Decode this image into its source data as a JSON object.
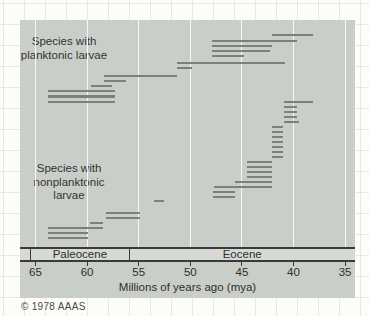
{
  "figure": {
    "copyright": "© 1978 AAAS"
  },
  "groups": {
    "planktonic": {
      "lines": [
        "Species with",
        "planktonic larvae"
      ]
    },
    "nonplanktonic": {
      "lines": [
        "Species with",
        "nonplanktonic",
        "larvae"
      ]
    }
  },
  "colors": {
    "panel_bg": "#cacec9",
    "bar": "#7d817c",
    "band_bg": "#d7dad4",
    "line_dark": "#3a3a3a",
    "text": "#333333",
    "gridline": "#ffffff"
  },
  "chart_data": {
    "type": "bar",
    "orientation": "horizontal-range",
    "xlabel": "Millions of years ago (mya)",
    "x_range": [
      65,
      35
    ],
    "x_axis_reversed": true,
    "x_ticks": [
      65,
      60,
      55,
      50,
      45,
      40,
      35
    ],
    "grid": "vertical-white-lines-at-ticks",
    "epochs": [
      {
        "name": "Paleocene",
        "from": 65.5,
        "to": 55.9
      },
      {
        "name": "Eocene",
        "from": 55.9,
        "to": 34.0
      }
    ],
    "series": [
      {
        "name": "Species with planktonic larvae",
        "bars": [
          {
            "from": 42.1,
            "to": 38.1,
            "y": 35
          },
          {
            "from": 47.9,
            "to": 39.7,
            "y": 41
          },
          {
            "from": 47.9,
            "to": 42.1,
            "y": 46
          },
          {
            "from": 47.9,
            "to": 42.3,
            "y": 51
          },
          {
            "from": 47.9,
            "to": 44.8,
            "y": 56
          },
          {
            "from": 51.3,
            "to": 40.8,
            "y": 63
          },
          {
            "from": 51.3,
            "to": 49.8,
            "y": 68
          },
          {
            "from": 58.4,
            "to": 51.3,
            "y": 76
          },
          {
            "from": 58.4,
            "to": 56.2,
            "y": 81
          },
          {
            "from": 59.6,
            "to": 57.6,
            "y": 86
          },
          {
            "from": 63.8,
            "to": 57.3,
            "y": 91
          },
          {
            "from": 63.8,
            "to": 57.3,
            "y": 96.5
          },
          {
            "from": 63.8,
            "to": 57.3,
            "y": 102
          }
        ]
      },
      {
        "name": "Species with nonplanktonic larvae",
        "bars": [
          {
            "from": 40.9,
            "to": 38.1,
            "y": 102
          },
          {
            "from": 40.9,
            "to": 39.7,
            "y": 107
          },
          {
            "from": 40.9,
            "to": 39.7,
            "y": 112
          },
          {
            "from": 40.9,
            "to": 39.7,
            "y": 117
          },
          {
            "from": 40.9,
            "to": 39.5,
            "y": 122
          },
          {
            "from": 42.1,
            "to": 41.0,
            "y": 127
          },
          {
            "from": 42.1,
            "to": 41.0,
            "y": 132
          },
          {
            "from": 42.1,
            "to": 41.0,
            "y": 137
          },
          {
            "from": 42.1,
            "to": 41.0,
            "y": 142
          },
          {
            "from": 42.1,
            "to": 41.0,
            "y": 147
          },
          {
            "from": 42.1,
            "to": 41.0,
            "y": 152
          },
          {
            "from": 42.1,
            "to": 41.0,
            "y": 157
          },
          {
            "from": 44.5,
            "to": 42.1,
            "y": 162
          },
          {
            "from": 44.5,
            "to": 42.1,
            "y": 167
          },
          {
            "from": 44.5,
            "to": 42.1,
            "y": 172
          },
          {
            "from": 44.5,
            "to": 42.1,
            "y": 177
          },
          {
            "from": 45.7,
            "to": 42.1,
            "y": 182
          },
          {
            "from": 47.7,
            "to": 42.1,
            "y": 187
          },
          {
            "from": 47.8,
            "to": 45.7,
            "y": 192
          },
          {
            "from": 47.8,
            "to": 45.7,
            "y": 197
          },
          {
            "from": 53.5,
            "to": 52.5,
            "y": 201
          },
          {
            "from": 58.2,
            "to": 54.9,
            "y": 213
          },
          {
            "from": 58.2,
            "to": 54.9,
            "y": 218
          },
          {
            "from": 59.7,
            "to": 58.5,
            "y": 223
          },
          {
            "from": 63.8,
            "to": 58.5,
            "y": 228
          },
          {
            "from": 63.8,
            "to": 59.9,
            "y": 233
          },
          {
            "from": 63.8,
            "to": 59.9,
            "y": 238
          }
        ]
      }
    ]
  }
}
